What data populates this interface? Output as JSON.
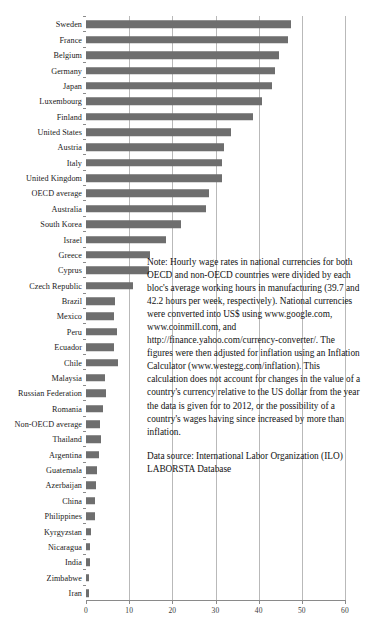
{
  "chart_data": {
    "type": "bar",
    "orientation": "horizontal",
    "title": "",
    "xlabel": "",
    "ylabel": "",
    "xlim": [
      0,
      60
    ],
    "xticks": [
      0,
      10,
      20,
      30,
      40,
      50,
      60
    ],
    "grid": true,
    "legend": false,
    "bar_color": "#6e6e6e",
    "categories": [
      "Sweden",
      "France",
      "Belgium",
      "Germany",
      "Japan",
      "Luxembourg",
      "Finland",
      "United States",
      "Austria",
      "Italy",
      "United Kingdom",
      "OECD average",
      "Australia",
      "South Korea",
      "Israel",
      "Greece",
      "Cyprus",
      "Czech Republic",
      "Brazil",
      "Mexico",
      "Peru",
      "Ecuador",
      "Chile",
      "Malaysia",
      "Russian Federation",
      "Romania",
      "Non-OECD average",
      "Thailand",
      "Argentina",
      "Guatemala",
      "Azerbaijan",
      "China",
      "Philippines",
      "Kyrgyzstan",
      "Nicaragua",
      "India",
      "Zimbabwe",
      "Iran"
    ],
    "values": [
      47.4,
      46.7,
      44.6,
      43.7,
      43.0,
      40.7,
      38.8,
      33.5,
      31.9,
      31.6,
      31.4,
      28.6,
      27.7,
      22.0,
      18.6,
      14.9,
      14.7,
      10.9,
      6.8,
      6.4,
      7.1,
      6.6,
      7.3,
      4.4,
      4.6,
      4.0,
      3.3,
      3.4,
      3.0,
      2.5,
      2.4,
      2.2,
      2.1,
      1.1,
      1.0,
      0.9,
      0.8,
      0.6
    ]
  },
  "note": {
    "paragraphs": [
      "Note: Hourly wage rates in national currencies for both OECD and non-OECD countries were divided by each bloc's average working hours in manufacturing (39.7 and 42.2 hours per week, respectively). National currencies were converted into US$ using www.google.com, www.coinmill.com, and http://finance.yahoo.com/currency-converter/.  The figures were then adjusted for inflation using an Inflation Calculator (www.westegg.com/inflation). This calculation does not account for changes in the value of a country's currency relative to the US dollar from the year the data is given for to 2012, or the possibility of a country's wages having since increased by more than inflation.",
      "Data source: International Labor Organization (ILO) LABORSTA Database"
    ]
  }
}
